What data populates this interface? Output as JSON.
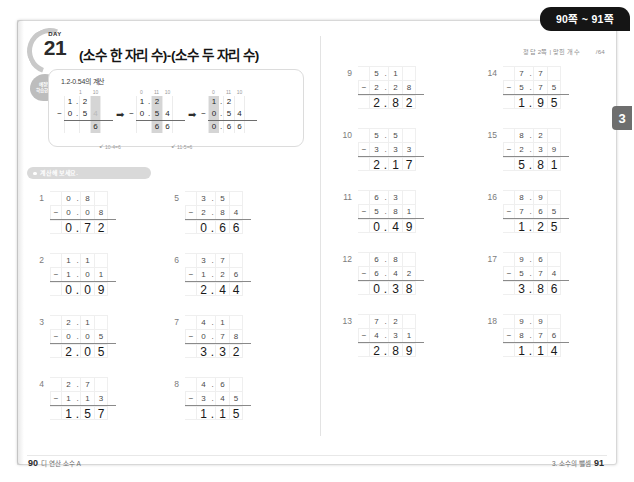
{
  "page_tab": {
    "label": "90쪽 ~ 91쪽"
  },
  "chapter_badge": {
    "label": "3"
  },
  "header": {
    "day_word": "DAY",
    "day_number": "21",
    "study_tag": "예정일\n학습한 날",
    "title": "(소수 한 자리 수)-(소수 두 자리 수)",
    "answer_ref": "정답 2쪽 | 맞힌 개수",
    "score_blank": "/64"
  },
  "example": {
    "caption": "1.2-0.54의 계산",
    "steps": [
      {
        "headers": [
          "1",
          "10"
        ],
        "minuend": [
          "1",
          ".",
          "2",
          ""
        ],
        "subtrahend": [
          "0",
          ".",
          "5",
          "4"
        ],
        "result": [
          "",
          "",
          "",
          "6"
        ],
        "note": "10-4=6"
      },
      {
        "headers": [
          "0",
          "11",
          "10"
        ],
        "minuend": [
          "1",
          ".",
          "2",
          ""
        ],
        "subtrahend": [
          "0",
          ".",
          "5",
          "4"
        ],
        "result": [
          "",
          "",
          "6",
          "6"
        ],
        "note": "11-5=6"
      },
      {
        "headers": [
          "0",
          "11",
          "10"
        ],
        "minuend": [
          "1",
          ".",
          "2",
          ""
        ],
        "subtrahend": [
          "0",
          ".",
          "5",
          "4"
        ],
        "result": [
          "0",
          ".",
          "6",
          "6"
        ],
        "note": ""
      }
    ],
    "operator": "−",
    "arrow": "➡"
  },
  "section": {
    "label": "계산해 보세요."
  },
  "operator": "−",
  "problems": [
    {
      "num": "1",
      "a": [
        "0",
        ".",
        "8",
        ""
      ],
      "b": [
        "0",
        ".",
        "0",
        "8"
      ],
      "r": [
        "0",
        ".",
        "7",
        "2"
      ]
    },
    {
      "num": "2",
      "a": [
        "1",
        ".",
        "1",
        ""
      ],
      "b": [
        "1",
        ".",
        "0",
        "1"
      ],
      "r": [
        "0",
        ".",
        "0",
        "9"
      ]
    },
    {
      "num": "3",
      "a": [
        "2",
        ".",
        "1",
        ""
      ],
      "b": [
        "0",
        ".",
        "0",
        "5"
      ],
      "r": [
        "2",
        ".",
        "0",
        "5"
      ]
    },
    {
      "num": "4",
      "a": [
        "2",
        ".",
        "7",
        ""
      ],
      "b": [
        "1",
        ".",
        "1",
        "3"
      ],
      "r": [
        "1",
        ".",
        "5",
        "7"
      ]
    },
    {
      "num": "5",
      "a": [
        "3",
        ".",
        "5",
        ""
      ],
      "b": [
        "2",
        ".",
        "8",
        "4"
      ],
      "r": [
        "0",
        ".",
        "6",
        "6"
      ]
    },
    {
      "num": "6",
      "a": [
        "3",
        ".",
        "7",
        ""
      ],
      "b": [
        "1",
        ".",
        "2",
        "6"
      ],
      "r": [
        "2",
        ".",
        "4",
        "4"
      ]
    },
    {
      "num": "7",
      "a": [
        "4",
        ".",
        "1",
        ""
      ],
      "b": [
        "0",
        ".",
        "7",
        "8"
      ],
      "r": [
        "3",
        ".",
        "3",
        "2"
      ]
    },
    {
      "num": "8",
      "a": [
        "4",
        ".",
        "6",
        ""
      ],
      "b": [
        "3",
        ".",
        "4",
        "5"
      ],
      "r": [
        "1",
        ".",
        "1",
        "5"
      ]
    },
    {
      "num": "9",
      "a": [
        "5",
        ".",
        "1",
        ""
      ],
      "b": [
        "2",
        ".",
        "2",
        "8"
      ],
      "r": [
        "2",
        ".",
        "8",
        "2"
      ]
    },
    {
      "num": "10",
      "a": [
        "5",
        ".",
        "5",
        ""
      ],
      "b": [
        "3",
        ".",
        "3",
        "3"
      ],
      "r": [
        "2",
        ".",
        "1",
        "7"
      ]
    },
    {
      "num": "11",
      "a": [
        "6",
        ".",
        "3",
        ""
      ],
      "b": [
        "5",
        ".",
        "8",
        "1"
      ],
      "r": [
        "0",
        ".",
        "4",
        "9"
      ]
    },
    {
      "num": "12",
      "a": [
        "6",
        ".",
        "8",
        ""
      ],
      "b": [
        "6",
        ".",
        "4",
        "2"
      ],
      "r": [
        "0",
        ".",
        "3",
        "8"
      ]
    },
    {
      "num": "13",
      "a": [
        "7",
        ".",
        "2",
        ""
      ],
      "b": [
        "4",
        ".",
        "3",
        "1"
      ],
      "r": [
        "2",
        ".",
        "8",
        "9"
      ]
    },
    {
      "num": "14",
      "a": [
        "7",
        ".",
        "7",
        ""
      ],
      "b": [
        "5",
        ".",
        "7",
        "5"
      ],
      "r": [
        "1",
        ".",
        "9",
        "5"
      ]
    },
    {
      "num": "15",
      "a": [
        "8",
        ".",
        "2",
        ""
      ],
      "b": [
        "2",
        ".",
        "3",
        "9"
      ],
      "r": [
        "5",
        ".",
        "8",
        "1"
      ]
    },
    {
      "num": "16",
      "a": [
        "8",
        ".",
        "9",
        ""
      ],
      "b": [
        "7",
        ".",
        "6",
        "5"
      ],
      "r": [
        "1",
        ".",
        "2",
        "5"
      ]
    },
    {
      "num": "17",
      "a": [
        "9",
        ".",
        "6",
        ""
      ],
      "b": [
        "5",
        ".",
        "7",
        "4"
      ],
      "r": [
        "3",
        ".",
        "8",
        "6"
      ]
    },
    {
      "num": "18",
      "a": [
        "9",
        ".",
        "9",
        ""
      ],
      "b": [
        "8",
        ".",
        "7",
        "6"
      ],
      "r": [
        "1",
        ".",
        "1",
        "4"
      ]
    }
  ],
  "footer": {
    "left_page": "90",
    "left_label": "디 연산 소수 A",
    "right_label": "3. 소수의 뺄셈",
    "right_page": "91"
  },
  "colors": {
    "tab_bg": "#151515",
    "badge_bg": "#6e6e6e",
    "pill_bg": "#d9d9d9",
    "highlight": "#d5d5d5",
    "answer_text": "#191919"
  }
}
